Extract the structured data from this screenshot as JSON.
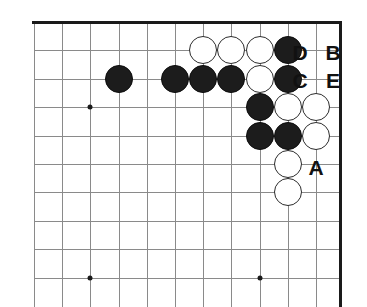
{
  "diagram": {
    "kind": "go-board-diagram",
    "board": {
      "columns": 11,
      "rows": 10,
      "origin_x": 34,
      "origin_y": 22,
      "spacing_x": 28.2,
      "spacing_y": 28.4,
      "right_edge_x": 340,
      "stone_diameter": 28,
      "line_color": "#8a8a8a",
      "edge_color": "#1a1a1a",
      "background_color": "#ffffff"
    },
    "star_points": [
      {
        "name": "star-point-upper-left",
        "col": 2,
        "row": 3
      },
      {
        "name": "star-point-lower-left",
        "col": 2,
        "row": 9
      },
      {
        "name": "star-point-lower-right",
        "col": 8,
        "row": 9
      }
    ],
    "stones": [
      {
        "id": "black-1",
        "color": "black",
        "col": 3,
        "row": 2
      },
      {
        "id": "black-2",
        "color": "black",
        "col": 5,
        "row": 2
      },
      {
        "id": "black-3",
        "color": "black",
        "col": 6,
        "row": 2
      },
      {
        "id": "black-4",
        "color": "black",
        "col": 7,
        "row": 2
      },
      {
        "id": "black-5",
        "color": "black",
        "col": 9,
        "row": 2
      },
      {
        "id": "black-6",
        "color": "black",
        "col": 9,
        "row": 1
      },
      {
        "id": "black-7",
        "color": "black",
        "col": 8,
        "row": 3
      },
      {
        "id": "black-8",
        "color": "black",
        "col": 8,
        "row": 4
      },
      {
        "id": "black-9",
        "color": "black",
        "col": 9,
        "row": 4
      },
      {
        "id": "white-1",
        "color": "white",
        "col": 6,
        "row": 1
      },
      {
        "id": "white-2",
        "color": "white",
        "col": 7,
        "row": 1
      },
      {
        "id": "white-3",
        "color": "white",
        "col": 8,
        "row": 1
      },
      {
        "id": "white-4",
        "color": "white",
        "col": 8,
        "row": 2
      },
      {
        "id": "white-5",
        "color": "white",
        "col": 9,
        "row": 3
      },
      {
        "id": "white-6",
        "color": "white",
        "col": 10,
        "row": 3
      },
      {
        "id": "white-7",
        "color": "white",
        "col": 10,
        "row": 4
      },
      {
        "id": "white-8",
        "color": "white",
        "col": 9,
        "row": 5
      },
      {
        "id": "white-9",
        "color": "white",
        "col": 9,
        "row": 6
      }
    ],
    "labels": [
      {
        "id": "label-d",
        "text": "D",
        "x": 300,
        "y": 52
      },
      {
        "id": "label-b",
        "text": "B",
        "x": 333,
        "y": 52
      },
      {
        "id": "label-c",
        "text": "C",
        "x": 300,
        "y": 80
      },
      {
        "id": "label-e",
        "text": "E",
        "x": 333,
        "y": 80
      },
      {
        "id": "label-a",
        "text": "A",
        "x": 316,
        "y": 167
      }
    ]
  }
}
